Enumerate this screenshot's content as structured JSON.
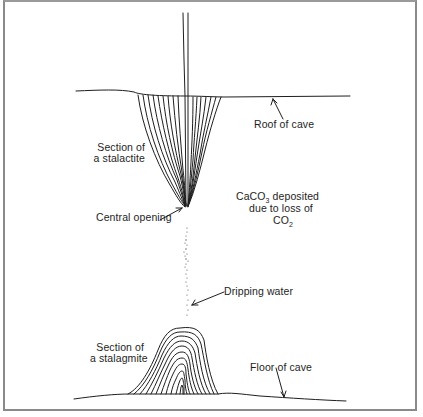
{
  "diagram": {
    "type": "cross-section",
    "labels": {
      "roof_of_cave": "Roof of cave",
      "stalactite_line1": "Section of",
      "stalactite_line2": "a stalactite",
      "central_opening": "Central opening",
      "caco3_prefix": "CaCO",
      "caco3_sub": "3",
      "caco3_suffix": " deposited",
      "loss_line": "due to loss of",
      "co2_prefix": "CO",
      "co2_sub": "2",
      "dripping_water": "Dripping water",
      "stalagmite_line1": "Section of",
      "stalagmite_line2": "a stalagmite",
      "floor_of_cave": "Floor of cave"
    },
    "colors": {
      "ink": "#1e1e1e",
      "frame": "#8a8a8a",
      "background": "#ffffff"
    }
  }
}
